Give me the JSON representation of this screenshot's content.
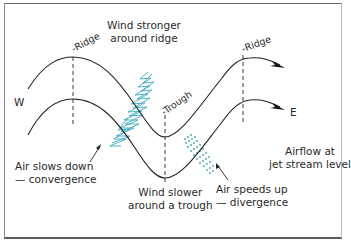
{
  "diagram": {
    "labels": {
      "wind_stronger_line1": "Wind stronger",
      "wind_stronger_line2": "around ridge",
      "ridge_left": "Ridge",
      "ridge_right": "Ridge",
      "trough": "Trough",
      "west": "W",
      "east": "E",
      "air_slows_line1": "Air slows down",
      "air_slows_line2": "— convergence",
      "wind_slower_line1": "Wind slower",
      "wind_slower_line2": "around a trough",
      "air_speeds_line1": "Air speeds up",
      "air_speeds_line2": "— divergence",
      "airflow_line1": "Airflow at",
      "airflow_line2": "jet stream level"
    },
    "colors": {
      "line": "#222222",
      "convergence": "#2aa3b8",
      "divergence": "#3aa6b6"
    }
  }
}
